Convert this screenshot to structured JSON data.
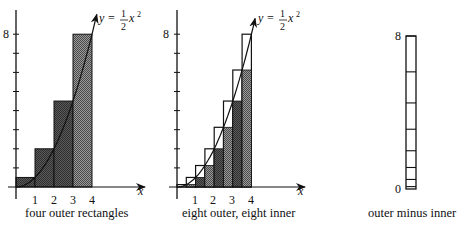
{
  "chart_data": [
    {
      "type": "bar",
      "title": "",
      "caption": "four outer rectangles",
      "function_label": "y = ½x²",
      "function": "y = 0.5*x^2",
      "xlabel": "x",
      "ylabel": "",
      "x_ticks": [
        "1",
        "2",
        "3",
        "4"
      ],
      "y_tick_label": "8",
      "xlim": [
        0,
        4
      ],
      "ylim": [
        0,
        8
      ],
      "rect_width": 1,
      "outer_rectangles": [
        {
          "x0": 0,
          "x1": 1,
          "height": 0.5
        },
        {
          "x0": 1,
          "x1": 2,
          "height": 2
        },
        {
          "x0": 2,
          "x1": 3,
          "height": 4.5
        },
        {
          "x0": 3,
          "x1": 4,
          "height": 8
        }
      ]
    },
    {
      "type": "bar",
      "title": "",
      "caption": "eight outer, eight inner",
      "function_label": "y = ½x²",
      "function": "y = 0.5*x^2",
      "xlabel": "x",
      "x_ticks": [
        "1",
        "2",
        "3",
        "4"
      ],
      "y_tick_label": "8",
      "xlim": [
        0,
        4
      ],
      "ylim": [
        0,
        8
      ],
      "rect_width": 0.5,
      "x_left": [
        0,
        0.5,
        1,
        1.5,
        2,
        2.5,
        3,
        3.5
      ],
      "outer_heights": [
        0.125,
        0.5,
        1.125,
        2,
        3.125,
        4.5,
        6.125,
        8
      ],
      "inner_heights": [
        0,
        0.125,
        0.5,
        1.125,
        2,
        3.125,
        4.5,
        6.125
      ]
    },
    {
      "type": "bar",
      "title": "",
      "caption": "outer minus inner",
      "y_tick_labels": [
        "0",
        "8"
      ],
      "ylim": [
        0,
        8
      ],
      "stacked_differences": [
        0.125,
        0.375,
        0.625,
        0.875,
        1.125,
        1.375,
        1.625,
        1.875
      ],
      "total": 8
    }
  ],
  "labels": {
    "eight": "8",
    "zero": "0",
    "x": "x",
    "t1": "1",
    "t2": "2",
    "t3": "3",
    "t4": "4",
    "y_eq": "y =",
    "half_num": "1",
    "half_den": "2",
    "x_sq": "x",
    "sq": "2"
  },
  "captions": {
    "left": "four outer rectangles",
    "middle": "eight outer, eight inner",
    "right": "outer minus inner"
  }
}
